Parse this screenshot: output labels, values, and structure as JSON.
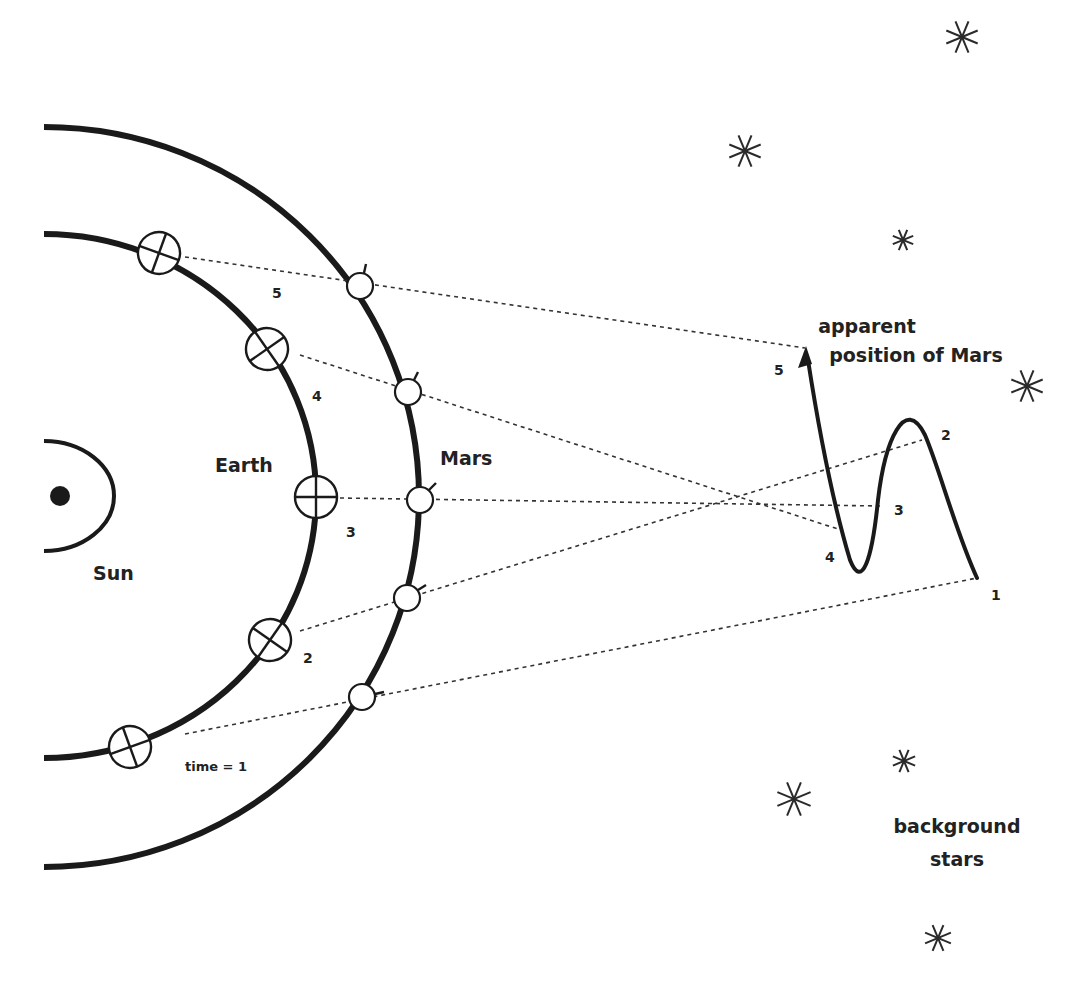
{
  "diagram": {
    "colors": {
      "ink": "#1a1a1a",
      "text": "#222222",
      "background": "#ffffff"
    },
    "labels": {
      "sun": "Sun",
      "earth": "Earth",
      "mars": "Mars",
      "apparent_line1": "apparent",
      "apparent_line2": "position of Mars",
      "background_line1": "background",
      "background_line2": "stars",
      "time_label": "time = 1"
    },
    "earth_positions": [
      {
        "id": "1",
        "label": "time = 1",
        "x": 130,
        "y": 747
      },
      {
        "id": "2",
        "label": "2",
        "x": 270,
        "y": 640
      },
      {
        "id": "3",
        "label": "3",
        "x": 316,
        "y": 497
      },
      {
        "id": "4",
        "label": "4",
        "x": 267,
        "y": 349
      },
      {
        "id": "5",
        "label": "5",
        "x": 159,
        "y": 253
      }
    ],
    "mars_positions": [
      {
        "id": "1",
        "x": 362,
        "y": 697
      },
      {
        "id": "2",
        "x": 407,
        "y": 598
      },
      {
        "id": "3",
        "x": 420,
        "y": 500
      },
      {
        "id": "4",
        "x": 408,
        "y": 392
      },
      {
        "id": "5",
        "x": 360,
        "y": 286
      }
    ],
    "apparent_positions": [
      {
        "id": "1",
        "label": "1",
        "x": 977,
        "y": 578
      },
      {
        "id": "2",
        "label": "2",
        "x": 922,
        "y": 440
      },
      {
        "id": "3",
        "label": "3",
        "x": 880,
        "y": 506
      },
      {
        "id": "4",
        "label": "4",
        "x": 841,
        "y": 530
      },
      {
        "id": "5",
        "label": "5",
        "x": 805,
        "y": 348
      }
    ],
    "stars": [
      {
        "x": 962,
        "y": 37,
        "r": 17
      },
      {
        "x": 745,
        "y": 151,
        "r": 17
      },
      {
        "x": 903,
        "y": 240,
        "r": 11
      },
      {
        "x": 1027,
        "y": 386,
        "r": 17
      },
      {
        "x": 904,
        "y": 761,
        "r": 12
      },
      {
        "x": 794,
        "y": 799,
        "r": 18
      },
      {
        "x": 938,
        "y": 938,
        "r": 14
      }
    ]
  }
}
